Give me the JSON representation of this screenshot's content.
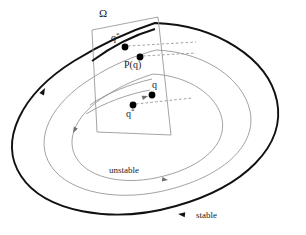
{
  "figure": {
    "background_color": "#ffffff",
    "stroke_dark": "#111111",
    "stroke_light": "#8a8a8a",
    "stroke_section": "#9a9a9a",
    "dot_color": "#000000",
    "dashed_color": "#8a8a8a",
    "labels": {
      "omega": "Ω",
      "q_star_top": "q",
      "q_star_top_sup": "*",
      "p_of_q": "P(q)",
      "q": "q",
      "q_star_bottom": "q",
      "q_star_bottom_sup": "*",
      "unstable": "unstable",
      "stable": "stable"
    },
    "section_polygon": {
      "name": "cross-section-Omega",
      "points": "92,30 158,17 171,135 97,132"
    },
    "points": [
      {
        "name": "q-star-top",
        "x": 125,
        "y": 47,
        "r": 3.4
      },
      {
        "name": "p-of-q",
        "x": 140,
        "y": 57,
        "r": 3.4
      },
      {
        "name": "q",
        "x": 152,
        "y": 95,
        "r": 3.4
      },
      {
        "name": "q-star-bottom",
        "x": 133,
        "y": 105,
        "r": 3.4
      }
    ],
    "dashed_connectors": [
      {
        "name": "dash-q-star-top",
        "d": "M 128 46 L 196 42"
      },
      {
        "name": "dash-p-of-q",
        "d": "M 143 56 L 196 53"
      },
      {
        "name": "dash-q-star-bottom",
        "d": "M 136 104 L 192 98"
      }
    ],
    "orbits": [
      {
        "name": "stable-periodic-orbit",
        "style": "thick",
        "width": 1.9,
        "color": "#111111",
        "d": "M 155 23 C 216 25 268 58 277 101 C 286 146 244 187 176 206 C 110 225 44 211 21 176 C -2 141 21 94 74 61 C 100 45 127 32 155 23 Z"
      },
      {
        "name": "unstable-orbit-outer",
        "style": "thin",
        "width": 0.8,
        "color": "#8a8a8a",
        "d": "M 156 50 C 204 52 243 78 250 111 C 257 145 224 175 171 189 C 120 203 69 193 51 166 C 33 139 51 103 92 78 C 112 65 134 56 156 50 Z"
      },
      {
        "name": "unstable-orbit-inner",
        "style": "thin",
        "width": 0.8,
        "color": "#8a8a8a",
        "d": "M 153 74 C 189 76 217 95 222 119 C 227 144 203 166 164 176 C 127 186 90 179 77 159 C 64 139 77 113 107 95 C 121 86 137 79 153 74 Z"
      }
    ],
    "arrows": [
      {
        "name": "arrow-stable-left",
        "x": 45,
        "y": 88,
        "angle": -62
      },
      {
        "name": "arrow-stable-bottom",
        "x": 178,
        "y": 214,
        "angle": 186
      },
      {
        "name": "arrow-unstable-left",
        "x": 73,
        "y": 133,
        "angle": 118
      },
      {
        "name": "arrow-unstable-mid",
        "x": 168,
        "y": 180,
        "angle": 8
      },
      {
        "name": "arrow-unstable-q",
        "x": 148,
        "y": 96,
        "angle": -18
      }
    ]
  }
}
